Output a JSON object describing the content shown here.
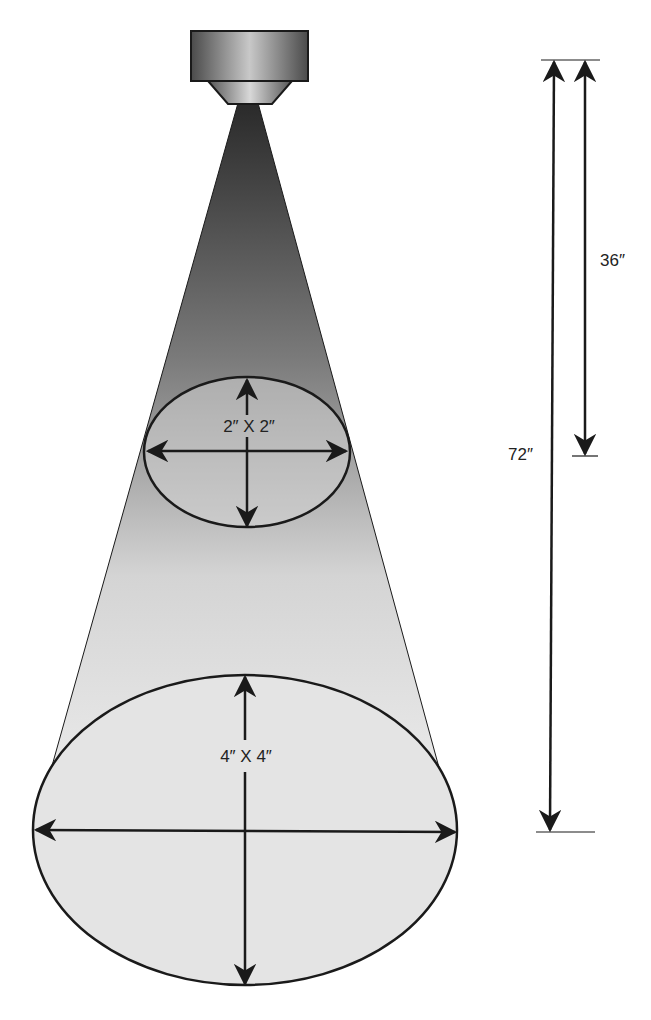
{
  "diagram": {
    "colors": {
      "line": "#1a1a1a",
      "cone_top": "#2e2e2e",
      "cone_bottom": "#eeeeee",
      "ellipse_fill": "#d9d9d9",
      "fixture_dark": "#4a4a4a",
      "fixture_light": "#d0d0d0"
    },
    "fixture": {
      "name": "light-fixture"
    },
    "beam_spots": [
      {
        "label": "2″ X 2″",
        "distance_label": "36″"
      },
      {
        "label": "4″ X 4″",
        "distance_label": "72″"
      }
    ],
    "dimensions": {
      "short": {
        "label": "36″"
      },
      "long": {
        "label": "72″"
      }
    }
  }
}
